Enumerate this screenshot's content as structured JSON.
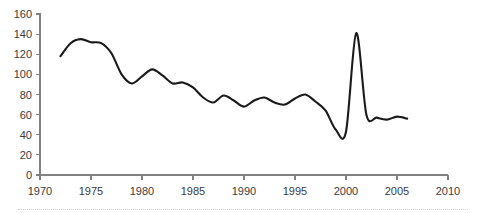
{
  "chart_data": {
    "type": "line",
    "title": "",
    "subtitle": "",
    "xlabel": "",
    "ylabel": "",
    "xlim": [
      1970,
      2010
    ],
    "ylim": [
      0,
      160
    ],
    "grid": false,
    "legend": "none",
    "x_ticks": [
      1970,
      1975,
      1980,
      1985,
      1990,
      1995,
      2000,
      2005,
      2010
    ],
    "y_ticks": [
      0,
      20,
      40,
      60,
      80,
      100,
      120,
      140,
      160
    ],
    "x_tick_labels": [
      "1970",
      "1975",
      "1980",
      "1985",
      "1990",
      "1995",
      "2000",
      "2005",
      "2010"
    ],
    "y_tick_labels": [
      "0",
      "20",
      "40",
      "60",
      "80",
      "100",
      "120",
      "140",
      "160"
    ],
    "line_color": "#1a1a1a",
    "axis_color": "#808080",
    "background_color": "#ffffff",
    "series": [
      {
        "name": "series-1",
        "x": [
          1972,
          1973,
          1974,
          1975,
          1976,
          1977,
          1978,
          1979,
          1980,
          1981,
          1982,
          1983,
          1984,
          1985,
          1986,
          1987,
          1988,
          1989,
          1990,
          1991,
          1992,
          1993,
          1994,
          1995,
          1996,
          1997,
          1998,
          1999,
          2000,
          2001,
          2002,
          2003,
          2004,
          2005,
          2006
        ],
        "values": [
          118,
          131,
          135,
          132,
          131,
          121,
          100,
          91,
          98,
          105,
          99,
          91,
          92,
          87,
          77,
          72,
          79,
          74,
          68,
          74,
          77,
          72,
          70,
          76,
          80,
          73,
          64,
          45,
          43,
          141,
          60,
          57,
          55,
          58,
          56
        ]
      }
    ]
  }
}
